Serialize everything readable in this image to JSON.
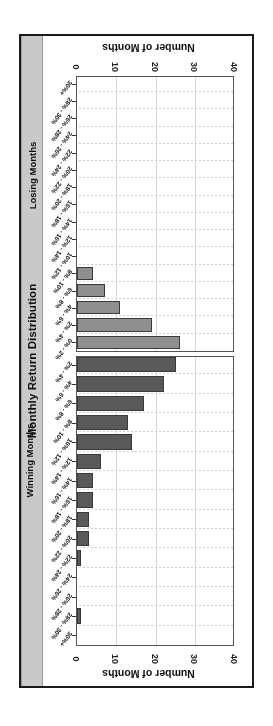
{
  "title": "Monthly Return Distribution",
  "axis": {
    "value_axis_label": "Number of Months",
    "ticks": [
      "0",
      "10",
      "20",
      "30",
      "40"
    ],
    "max": 40
  },
  "groups": {
    "winning_label": "Winning Months",
    "losing_label": "Losing Months"
  },
  "colors": {
    "winning_bar": "#595959",
    "losing_bar": "#8f8f8f",
    "title_bar": "#c9c9c9",
    "frame": "#1a1a1a",
    "grid": "#d8d8d8"
  },
  "chart_data": {
    "type": "bar",
    "title": "Monthly Return Distribution",
    "xlabel": "Number of Months",
    "ylabel": "",
    "xlim": [
      0,
      40
    ],
    "grid": true,
    "orientation": "horizontal",
    "legend_position": "none",
    "series": [
      {
        "name": "Winning Months",
        "color": "#595959",
        "categories": [
          "30%+",
          "28% - 30%",
          "26% - 28%",
          "24% - 26%",
          "22% - 24%",
          "20% - 22%",
          "18% - 20%",
          "16% - 18%",
          "14% - 16%",
          "12% - 14%",
          "10% - 12%",
          "8% - 10%",
          "6% - 8%",
          "4% - 6%",
          "2% - 4%"
        ],
        "values": [
          0,
          1,
          0,
          0,
          1,
          3,
          3,
          4,
          4,
          6,
          14,
          13,
          17,
          22,
          25
        ]
      },
      {
        "name": "Losing Months",
        "color": "#8f8f8f",
        "categories": [
          "0% - 2%",
          "2% - 4%",
          "4% - 6%",
          "6% - 8%",
          "8% - 10%",
          "10% - 12%",
          "12% - 14%",
          "14% - 16%",
          "16% - 18%",
          "18% - 20%",
          "20% - 22%",
          "22% - 24%",
          "24% - 26%",
          "26% - 28%",
          "28% - 30%",
          "30%+"
        ],
        "values": [
          26,
          19,
          11,
          7,
          4,
          0,
          0,
          0,
          0,
          0,
          0,
          0,
          0,
          0,
          0,
          0
        ]
      }
    ]
  }
}
